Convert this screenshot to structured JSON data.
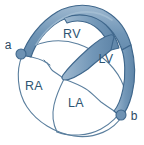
{
  "figure": {
    "background_color": "#ffffff"
  },
  "colors": {
    "band_fill": "#7196b7",
    "band_fill_light": "#9ab5cd",
    "band_outline": "#3f678c",
    "chamber_outline": "#5b7f9e",
    "chamber_fill": "#ffffff",
    "label_text": "#2d5472",
    "marker_fill": "#6e92b3",
    "marker_outline": "#3f678c"
  },
  "chambers": [
    {
      "id": "rv",
      "label": "RV",
      "name": "right-ventricle",
      "x": 72,
      "y": 38
    },
    {
      "id": "lv",
      "label": "LV",
      "name": "left-ventricle",
      "x": 106,
      "y": 63
    },
    {
      "id": "ra",
      "label": "RA",
      "name": "right-atrium",
      "x": 34,
      "y": 90
    },
    {
      "id": "la",
      "label": "LA",
      "name": "left-atrium",
      "x": 76,
      "y": 107
    }
  ],
  "markers": [
    {
      "id": "a",
      "label": "a",
      "name": "band-start-point",
      "dot_x": 21,
      "dot_y": 54,
      "dot_r": 5,
      "label_x": 8,
      "label_y": 48
    },
    {
      "id": "b",
      "label": "b",
      "name": "band-end-point",
      "dot_x": 121,
      "dot_y": 115,
      "dot_r": 5,
      "label_x": 131,
      "label_y": 120
    }
  ],
  "band": {
    "name": "helical-ventricular-myocardial-band",
    "segments": [
      "left-ascending",
      "apical-loop",
      "right-descending",
      "central-descending"
    ]
  }
}
